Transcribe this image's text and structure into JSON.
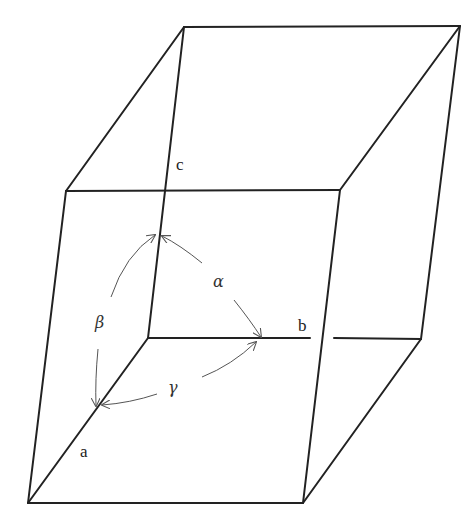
{
  "diagram": {
    "axes": [
      {
        "id": "a",
        "label": "a"
      },
      {
        "id": "b",
        "label": "b"
      },
      {
        "id": "c",
        "label": "c"
      }
    ],
    "angles": [
      {
        "id": "alpha",
        "label": "α",
        "between": "b-c"
      },
      {
        "id": "beta",
        "label": "β",
        "between": "a-c"
      },
      {
        "id": "gamma",
        "label": "γ",
        "between": "a-b"
      }
    ],
    "colors": {
      "edges": "#222222",
      "arcs": "#555555",
      "background": "#ffffff"
    }
  }
}
